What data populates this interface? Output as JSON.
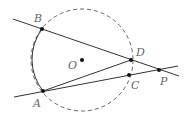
{
  "diagram": {
    "type": "geometry",
    "circle": {
      "center_label": "O",
      "style": "dashed except solid arc from B to A on left"
    },
    "points": [
      {
        "label": "B",
        "x": 42,
        "y": 29
      },
      {
        "label": "A",
        "x": 43,
        "y": 91
      },
      {
        "label": "D",
        "x": 131,
        "y": 60
      },
      {
        "label": "C",
        "x": 129,
        "y": 75
      },
      {
        "label": "P",
        "x": 159,
        "y": 70
      },
      {
        "label": "O",
        "x": 82,
        "y": 60
      }
    ],
    "segments": [
      "B-P (secant through D)",
      "A-P (secant through C)",
      "A-D"
    ],
    "labels": {
      "A": "A",
      "B": "B",
      "C": "C",
      "D": "D",
      "O": "O",
      "P": "P"
    }
  }
}
